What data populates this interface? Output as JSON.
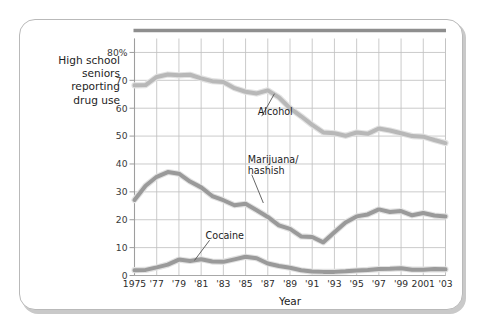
{
  "figure": {
    "ylabel_lines": [
      "High school",
      "seniors",
      "reporting",
      "drug use"
    ],
    "xaxis_title": "Year"
  },
  "chart_data": {
    "type": "line",
    "title": "",
    "subtitle": "",
    "xlabel": "Year",
    "ylabel": "High school seniors reporting drug use",
    "ylabel_unit": "%",
    "grid": true,
    "legend_position": "inline-annotations",
    "xlim": [
      1975,
      2003
    ],
    "ylim": [
      0,
      85
    ],
    "yticks": [
      0,
      10,
      20,
      30,
      40,
      50,
      60,
      70,
      80
    ],
    "ytick_labels": [
      "0",
      "10",
      "20",
      "30",
      "40",
      "50",
      "60",
      "70",
      "80%"
    ],
    "x": [
      1975,
      1976,
      1977,
      1978,
      1979,
      1980,
      1981,
      1982,
      1983,
      1984,
      1985,
      1986,
      1987,
      1988,
      1989,
      1990,
      1991,
      1992,
      1993,
      1994,
      1995,
      1996,
      1997,
      1998,
      1999,
      2000,
      2001,
      2002,
      2003
    ],
    "xtick_values": [
      1975,
      1977,
      1979,
      1981,
      1983,
      1985,
      1987,
      1989,
      1991,
      1993,
      1995,
      1997,
      1999,
      2001,
      2003
    ],
    "xtick_labels": [
      "1975",
      "'77",
      "'79",
      "'81",
      "'83",
      "'85",
      "'87",
      "'89",
      "'91",
      "'93",
      "'95",
      "'97",
      "'99",
      "2001",
      "'03"
    ],
    "series": [
      {
        "name": "Alcohol",
        "color": "#b8b8b8",
        "annotation": "Alcohol",
        "values": [
          68.2,
          68.3,
          71.2,
          72.1,
          71.8,
          72.0,
          70.7,
          69.7,
          69.4,
          67.2,
          65.9,
          65.3,
          66.4,
          63.9,
          60.0,
          57.1,
          54.0,
          51.3,
          51.0,
          50.1,
          51.3,
          50.8,
          52.7,
          52.0,
          51.0,
          50.0,
          49.8,
          48.6,
          47.5
        ]
      },
      {
        "name": "Marijuana/hashish",
        "color": "#9a9a9a",
        "annotation": "Marijuana/\nhashish",
        "annotation_lines": [
          "Marijuana/",
          "hashish"
        ],
        "values": [
          27.1,
          32.2,
          35.4,
          37.1,
          36.5,
          33.7,
          31.6,
          28.5,
          27.0,
          25.2,
          25.7,
          23.4,
          21.0,
          18.0,
          16.7,
          14.0,
          13.8,
          11.9,
          15.5,
          19.0,
          21.2,
          21.9,
          23.7,
          22.8,
          23.1,
          21.6,
          22.4,
          21.5,
          21.2
        ]
      },
      {
        "name": "Cocaine",
        "color": "#9a9a9a",
        "annotation": "Cocaine",
        "values": [
          1.9,
          2.0,
          2.9,
          3.9,
          5.7,
          5.2,
          5.8,
          5.0,
          4.9,
          5.8,
          6.7,
          6.2,
          4.3,
          3.4,
          2.8,
          1.9,
          1.4,
          1.3,
          1.3,
          1.5,
          1.8,
          2.0,
          2.3,
          2.4,
          2.6,
          2.1,
          2.1,
          2.3,
          2.2
        ]
      }
    ],
    "annotations": [
      {
        "label": "Alcohol",
        "x": 1986.1,
        "y": 57.5,
        "leader_to_x": 1987.6,
        "leader_to_y": 65.2
      },
      {
        "label": "Marijuana/hashish",
        "x": 1985.2,
        "y": 36.5,
        "leader_to_x": 1986.6,
        "leader_to_y": 26.0
      },
      {
        "label": "Cocaine",
        "x": 1981.4,
        "y": 13.0,
        "leader_to_x": 1980.4,
        "leader_to_y": 5.4
      }
    ]
  }
}
